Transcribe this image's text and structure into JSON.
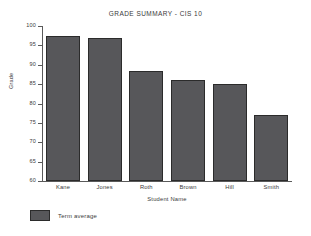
{
  "chart_data": {
    "type": "bar",
    "title": "GRADE SUMMARY - CIS 10",
    "xlabel": "Student Name",
    "ylabel": "Grade",
    "categories": [
      "Kane",
      "Jones",
      "Roth",
      "Brown",
      "Hill",
      "Smith"
    ],
    "values": [
      97.5,
      97,
      88.5,
      86,
      85,
      77
    ],
    "series": [
      {
        "name": "Term average",
        "values": [
          97.5,
          97,
          88.5,
          86,
          85,
          77
        ]
      }
    ],
    "ylim": [
      60,
      100
    ],
    "ytick_labels": [
      "100",
      "95",
      "90",
      "85",
      "80",
      "75",
      "70",
      "65",
      "60"
    ],
    "ytick_values": [
      100,
      95,
      90,
      85,
      80,
      75,
      70,
      65,
      60
    ],
    "grid": false,
    "legend_position": "below-left",
    "legend_entries": [
      "Term average"
    ],
    "bar_color": "#57575a",
    "bar_edge_color": "#2b2b2b",
    "axis_color": "#5a5a5a",
    "background_color": "#ffffff"
  }
}
